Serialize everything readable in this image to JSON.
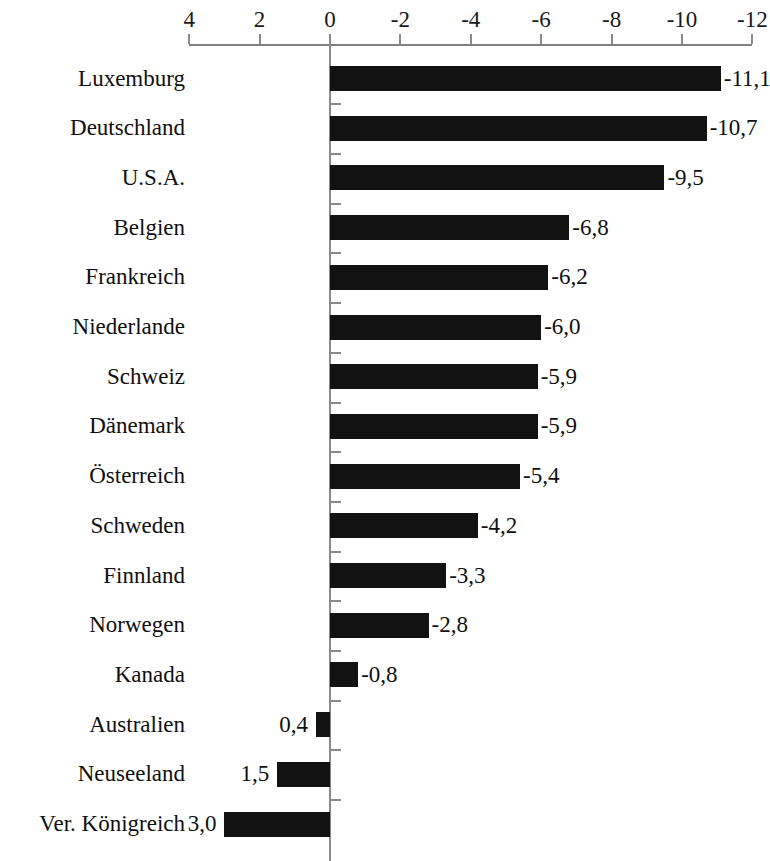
{
  "chart_data": {
    "type": "bar",
    "orientation": "horizontal",
    "title": "",
    "subtitle": "",
    "xlabel": "",
    "ylabel": "",
    "grid": false,
    "legend": null,
    "axis_reversed": true,
    "xlim": [
      4,
      -12
    ],
    "xticks": [
      "4",
      "2",
      "0",
      "-2",
      "-4",
      "-6",
      "-8",
      "-10",
      "-12"
    ],
    "xtick_values": [
      4,
      2,
      0,
      -2,
      -4,
      -6,
      -8,
      -10,
      -12
    ],
    "categories": [
      "Luxemburg",
      "Deutschland",
      "U.S.A.",
      "Belgien",
      "Frankreich",
      "Niederlande",
      "Schweiz",
      "Dänemark",
      "Österreich",
      "Schweden",
      "Finnland",
      "Norwegen",
      "Kanada",
      "Australien",
      "Neuseeland",
      "Ver. Königreich"
    ],
    "values": [
      -11.1,
      -10.7,
      -9.5,
      -6.8,
      -6.2,
      -6.0,
      -5.9,
      -5.9,
      -5.4,
      -4.2,
      -3.3,
      -2.8,
      -0.8,
      0.4,
      1.5,
      3.0
    ],
    "value_labels": [
      "-11,1",
      "-10,7",
      "-9,5",
      "-6,8",
      "-6,2",
      "-6,0",
      "-5,9",
      "-5,9",
      "-5,4",
      "-4,2",
      "-3,3",
      "-2,8",
      "-0,8",
      "0,4",
      "1,5",
      "3,0"
    ],
    "bar_color": "#121212",
    "axis_color": "#8a8a8a"
  }
}
